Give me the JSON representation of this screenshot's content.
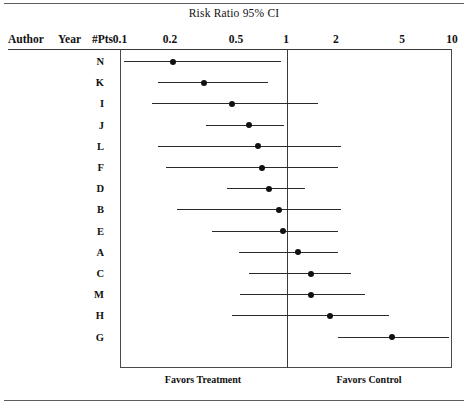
{
  "title": "Risk Ratio 95% CI",
  "columns": {
    "author": "Author",
    "year": "Year",
    "pts": "#Pts"
  },
  "axis": {
    "ticks": [
      "0.1",
      "0.2",
      "0.5",
      "1",
      "2",
      "5",
      "10"
    ],
    "tick_values": [
      0.1,
      0.2,
      0.5,
      1,
      2,
      5,
      10
    ],
    "scale": "log",
    "min": 0.1,
    "max": 10,
    "null_value": 1
  },
  "footer": {
    "left": "Favors Treatment",
    "right": "Favors Control"
  },
  "chart_data": {
    "type": "forest",
    "title": "Risk Ratio 95% CI",
    "xlabel": "",
    "ylabel": "",
    "xscale": "log",
    "xlim": [
      0.1,
      10
    ],
    "null_line": 1,
    "grid": false,
    "xticks": [
      0.1,
      0.2,
      0.5,
      1,
      2,
      5,
      10
    ],
    "xticklabels": [
      "0.1",
      "0.2",
      "0.5",
      "1",
      "2",
      "5",
      "10"
    ],
    "left_annotation": "Favors Treatment",
    "right_annotation": "Favors Control",
    "columns": [
      "Author",
      "Year",
      "#Pts"
    ],
    "rows": [
      {
        "author": "N",
        "year": "",
        "pts": "",
        "estimate": 0.21,
        "low": 0.105,
        "high": 0.93
      },
      {
        "author": "K",
        "year": "",
        "pts": "",
        "estimate": 0.32,
        "low": 0.17,
        "high": 0.78
      },
      {
        "author": "I",
        "year": "",
        "pts": "",
        "estimate": 0.47,
        "low": 0.155,
        "high": 1.55
      },
      {
        "author": "J",
        "year": "",
        "pts": "",
        "estimate": 0.6,
        "low": 0.33,
        "high": 0.97
      },
      {
        "author": "L",
        "year": "",
        "pts": "",
        "estimate": 0.68,
        "low": 0.17,
        "high": 2.15
      },
      {
        "author": "F",
        "year": "",
        "pts": "",
        "estimate": 0.72,
        "low": 0.19,
        "high": 2.05
      },
      {
        "author": "D",
        "year": "",
        "pts": "",
        "estimate": 0.79,
        "low": 0.44,
        "high": 1.3
      },
      {
        "author": "B",
        "year": "",
        "pts": "",
        "estimate": 0.91,
        "low": 0.22,
        "high": 2.15
      },
      {
        "author": "E",
        "year": "",
        "pts": "",
        "estimate": 0.96,
        "low": 0.36,
        "high": 2.05
      },
      {
        "author": "A",
        "year": "",
        "pts": "",
        "estimate": 1.18,
        "low": 0.52,
        "high": 2.05
      },
      {
        "author": "C",
        "year": "",
        "pts": "",
        "estimate": 1.42,
        "low": 0.6,
        "high": 2.45
      },
      {
        "author": "M",
        "year": "",
        "pts": "",
        "estimate": 1.42,
        "low": 0.53,
        "high": 3.0
      },
      {
        "author": "H",
        "year": "",
        "pts": "",
        "estimate": 1.85,
        "low": 0.47,
        "high": 4.2
      },
      {
        "author": "G",
        "year": "",
        "pts": "",
        "estimate": 4.35,
        "low": 2.05,
        "high": 9.6
      }
    ]
  }
}
